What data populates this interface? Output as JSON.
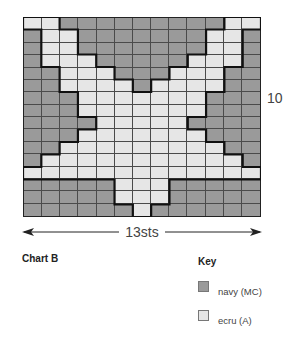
{
  "chart": {
    "title": "Chart B",
    "columns": 13,
    "rows_count": 16,
    "row_marker_label": "10",
    "width_label": "13sts",
    "colors": {
      "D": "#9a9a9a",
      "L": "#e6e6e6"
    },
    "rows": [
      "LLDDDDDDDDDLL",
      "DLLDDDDDDDLLD",
      "DLLDDDDDDDLLD",
      "DLLLDDDDDLLLD",
      "DDLLLDDDLLLDD",
      "DDLLLLDLLLLDD",
      "DDDLLLLLLLDDD",
      "DDDLLLLLLLDDD",
      "DDDDLLLLLDDDD",
      "DDDLLLLLLLDDD",
      "DDLLLLLLLLLDD",
      "DLLLLLLLLLLLD",
      "LLLLLLLLLLLLL",
      "DDDDDLLLDDDDD",
      "DDDDDLLLDDDDD",
      "DDDDDDLDDDDDD"
    ]
  },
  "key": {
    "title": "Key",
    "items": [
      {
        "code": "D",
        "label": "navy (MC)",
        "color": "#9a9a9a"
      },
      {
        "code": "L",
        "label": "ecru (A)",
        "color": "#e6e6e6"
      }
    ]
  }
}
